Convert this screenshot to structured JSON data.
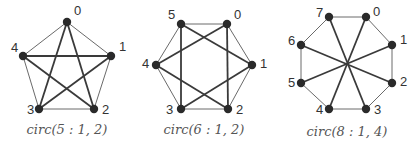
{
  "graphs": [
    {
      "caption": "circ(5 : 1, 2)",
      "n": 5,
      "jumps": [
        1,
        2
      ],
      "nodes": [
        {
          "id": "0",
          "x": 67,
          "y": 22,
          "lx": 74,
          "ly": 15
        },
        {
          "id": "1",
          "x": 111,
          "y": 56,
          "lx": 119,
          "ly": 51
        },
        {
          "id": "2",
          "x": 94,
          "y": 109,
          "lx": 102,
          "ly": 114
        },
        {
          "id": "3",
          "x": 39,
          "y": 109,
          "lx": 27,
          "ly": 114
        },
        {
          "id": "4",
          "x": 23,
          "y": 56,
          "lx": 11,
          "ly": 52
        }
      ],
      "edges_outer": [
        [
          0,
          1
        ],
        [
          1,
          2
        ],
        [
          2,
          3
        ],
        [
          3,
          4
        ],
        [
          4,
          0
        ]
      ],
      "edges_chord": [
        [
          0,
          2
        ],
        [
          0,
          3
        ],
        [
          1,
          3
        ],
        [
          1,
          4
        ],
        [
          2,
          4
        ]
      ]
    },
    {
      "caption": "circ(6 : 1, 2)",
      "n": 6,
      "jumps": [
        1,
        2
      ],
      "nodes": [
        {
          "id": "0",
          "x": 227,
          "y": 24,
          "lx": 234,
          "ly": 19
        },
        {
          "id": "1",
          "x": 252,
          "y": 65,
          "lx": 260,
          "ly": 68
        },
        {
          "id": "2",
          "x": 228,
          "y": 109,
          "lx": 236,
          "ly": 114
        },
        {
          "id": "3",
          "x": 181,
          "y": 109,
          "lx": 166,
          "ly": 114
        },
        {
          "id": "4",
          "x": 156,
          "y": 65,
          "lx": 142,
          "ly": 68
        },
        {
          "id": "5",
          "x": 181,
          "y": 24,
          "lx": 168,
          "ly": 19
        }
      ],
      "edges_outer": [
        [
          0,
          1
        ],
        [
          1,
          2
        ],
        [
          2,
          3
        ],
        [
          3,
          4
        ],
        [
          4,
          5
        ],
        [
          5,
          0
        ]
      ],
      "edges_chord": [
        [
          0,
          2
        ],
        [
          1,
          3
        ],
        [
          2,
          4
        ],
        [
          3,
          5
        ],
        [
          4,
          0
        ],
        [
          5,
          1
        ]
      ]
    },
    {
      "caption": "circ(8 : 1, 4)",
      "n": 8,
      "jumps": [
        1,
        4
      ],
      "nodes": [
        {
          "id": "0",
          "x": 366,
          "y": 17,
          "lx": 373,
          "ly": 16
        },
        {
          "id": "1",
          "x": 392,
          "y": 45,
          "lx": 400,
          "ly": 44
        },
        {
          "id": "2",
          "x": 392,
          "y": 83,
          "lx": 400,
          "ly": 86
        },
        {
          "id": "3",
          "x": 366,
          "y": 109,
          "lx": 374,
          "ly": 114
        },
        {
          "id": "4",
          "x": 329,
          "y": 109,
          "lx": 316,
          "ly": 114
        },
        {
          "id": "5",
          "x": 301,
          "y": 83,
          "lx": 288,
          "ly": 87
        },
        {
          "id": "6",
          "x": 301,
          "y": 45,
          "lx": 288,
          "ly": 45
        },
        {
          "id": "7",
          "x": 329,
          "y": 17,
          "lx": 316,
          "ly": 17
        }
      ],
      "edges_outer": [
        [
          0,
          1
        ],
        [
          1,
          2
        ],
        [
          2,
          3
        ],
        [
          3,
          4
        ],
        [
          4,
          5
        ],
        [
          5,
          6
        ],
        [
          6,
          7
        ],
        [
          7,
          0
        ]
      ],
      "edges_chord": [
        [
          0,
          4
        ],
        [
          1,
          5
        ],
        [
          2,
          6
        ],
        [
          3,
          7
        ]
      ]
    }
  ],
  "caption_positions": [
    {
      "x": 67,
      "y": 134
    },
    {
      "x": 204,
      "y": 134
    },
    {
      "x": 347,
      "y": 136
    }
  ]
}
